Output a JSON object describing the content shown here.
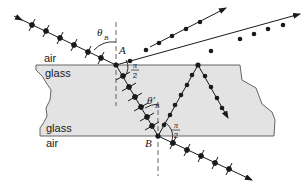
{
  "diagram": {
    "colors": {
      "glass_fill": "#e3e3e3",
      "glass_edge": "#555555",
      "ray": "#1a1a1a",
      "normal": "#555555",
      "background": "#ffffff"
    },
    "labels": {
      "air_top": "air",
      "glass_top": "glass",
      "glass_bottom": "glass",
      "air_bottom": "air",
      "point_a": "A",
      "point_b": "B",
      "theta_b": "θ",
      "theta_b_sub": "B",
      "theta_b_prime": "θ′",
      "theta_b_prime_sub": "B",
      "right_angle_top_num": "π",
      "right_angle_top_den": "2",
      "right_angle_bottom_num": "π",
      "right_angle_bottom_den": "2"
    },
    "rays": [
      {
        "name": "incident",
        "polarization": "both (dots and arrows)"
      },
      {
        "name": "reflected-at-A",
        "polarization": "dots only (s-polarized)"
      },
      {
        "name": "refracted-in-glass",
        "polarization": "both"
      },
      {
        "name": "transmitted-at-B",
        "polarization": "both"
      },
      {
        "name": "reflected-at-B",
        "polarization": "dots only"
      },
      {
        "name": "exiting-top",
        "polarization": "dots only"
      },
      {
        "name": "internal-reflection",
        "polarization": "dots only"
      },
      {
        "name": "upper-parallel-reflected",
        "polarization": "dots only"
      }
    ]
  }
}
